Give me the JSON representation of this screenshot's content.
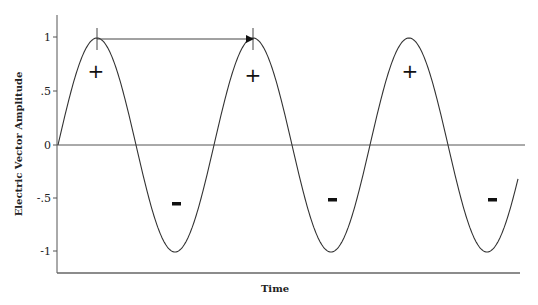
{
  "chart_data": {
    "type": "line",
    "title": "",
    "xlabel": "Time",
    "ylabel": "Electric Vector Amplitude",
    "ylim": [
      -1.2,
      1.2
    ],
    "yticks": [
      1,
      0.5,
      0,
      -0.5,
      -1
    ],
    "ytick_labels": [
      "1",
      ".5",
      "0",
      "-.5",
      "-1"
    ],
    "grid": false,
    "legend": null,
    "series": [
      {
        "name": "sine wave",
        "function": "sin(2*pi*t)",
        "cycles": 2.95,
        "x": [
          0,
          0.25,
          0.5,
          0.75,
          1.0,
          1.25,
          1.5,
          1.75,
          2.0,
          2.25,
          2.5,
          2.75,
          2.95
        ],
        "values": [
          0,
          1,
          0,
          -1,
          0,
          1,
          0,
          -1,
          0,
          1,
          0,
          -1,
          -0.31
        ]
      }
    ],
    "annotations": [
      {
        "type": "arrow",
        "label": "wavelength",
        "from_peak": 1,
        "to_peak": 2,
        "y": 1
      },
      {
        "type": "text",
        "text": "+",
        "near": "peak 1"
      },
      {
        "type": "text",
        "text": "+",
        "near": "peak 2"
      },
      {
        "type": "text",
        "text": "+",
        "near": "peak 3"
      },
      {
        "type": "text",
        "text": "-",
        "near": "trough 1"
      },
      {
        "type": "text",
        "text": "-",
        "near": "trough 2"
      },
      {
        "type": "text",
        "text": "-",
        "near": "trough 3"
      }
    ]
  },
  "labels": {
    "xlabel": "Time",
    "ylabel": "Electric Vector Amplitude",
    "ticks": [
      "1",
      ".5",
      "0",
      "-.5",
      "-1"
    ],
    "plus": "+",
    "minus": "-"
  },
  "colors": {
    "line": "#333333",
    "axis": "#555555",
    "text": "#222222"
  }
}
